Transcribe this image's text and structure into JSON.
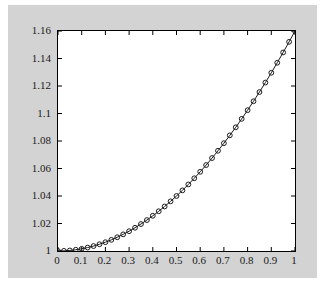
{
  "figure": {
    "background": "#ffffff",
    "canvas_color": "#d3d3d3",
    "axes_background": "#ffffff",
    "axes_border_color": "#000000",
    "tick_color": "#000000",
    "label_color": "#1a1a1a"
  },
  "chart_data": {
    "type": "line",
    "title": "",
    "xlabel": "",
    "ylabel": "",
    "xlim": [
      0,
      1
    ],
    "ylim": [
      1,
      1.16
    ],
    "grid": false,
    "legend": null,
    "x_ticks": [
      0,
      0.1,
      0.2,
      0.3,
      0.4,
      0.5,
      0.6,
      0.7,
      0.8,
      0.9,
      1
    ],
    "x_tick_labels": [
      "0",
      "0.1",
      "0.2",
      "0.3",
      "0.4",
      "0.5",
      "0.6",
      "0.7",
      "0.8",
      "0.9",
      "1"
    ],
    "y_ticks": [
      1,
      1.02,
      1.04,
      1.06,
      1.08,
      1.1,
      1.12,
      1.14,
      1.16
    ],
    "y_tick_labels": [
      "1",
      "1.02",
      "1.04",
      "1.06",
      "1.08",
      "1.1",
      "1.12",
      "1.14",
      "1.16"
    ],
    "line_color": "#1a1a1a",
    "marker": "o",
    "marker_color": "#1a1a1a",
    "series": [
      {
        "name": "series-1",
        "x": [
          0,
          0.025,
          0.05,
          0.075,
          0.1,
          0.125,
          0.15,
          0.175,
          0.2,
          0.225,
          0.25,
          0.275,
          0.3,
          0.325,
          0.35,
          0.375,
          0.4,
          0.425,
          0.45,
          0.475,
          0.5,
          0.525,
          0.55,
          0.575,
          0.6,
          0.625,
          0.65,
          0.675,
          0.7,
          0.725,
          0.75,
          0.775,
          0.8,
          0.825,
          0.85,
          0.875,
          0.9,
          0.925,
          0.95,
          0.975,
          1
        ],
        "y": [
          1.0,
          1.0001,
          1.0004,
          1.0009,
          1.0016,
          1.0025,
          1.0036,
          1.0049,
          1.0064,
          1.0081,
          1.01,
          1.0121,
          1.0144,
          1.0169,
          1.0196,
          1.0225,
          1.0256,
          1.0289,
          1.0324,
          1.0361,
          1.04,
          1.0441,
          1.0484,
          1.0529,
          1.0576,
          1.0625,
          1.0676,
          1.0729,
          1.0784,
          1.0841,
          1.09,
          1.0961,
          1.1024,
          1.1089,
          1.1156,
          1.1225,
          1.1296,
          1.1369,
          1.1444,
          1.1521,
          1.16
        ]
      }
    ]
  }
}
